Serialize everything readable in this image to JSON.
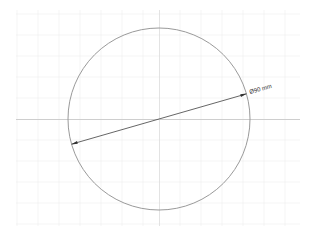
{
  "drawing": {
    "type": "circle-diameter-dimension",
    "dimension_label": "Ø90 mm",
    "colors": {
      "background": "#ffffff",
      "grid": "#ececec",
      "axis": "#c8c8c8",
      "circle": "#9a9a9a",
      "dimension_line": "#555555"
    }
  }
}
